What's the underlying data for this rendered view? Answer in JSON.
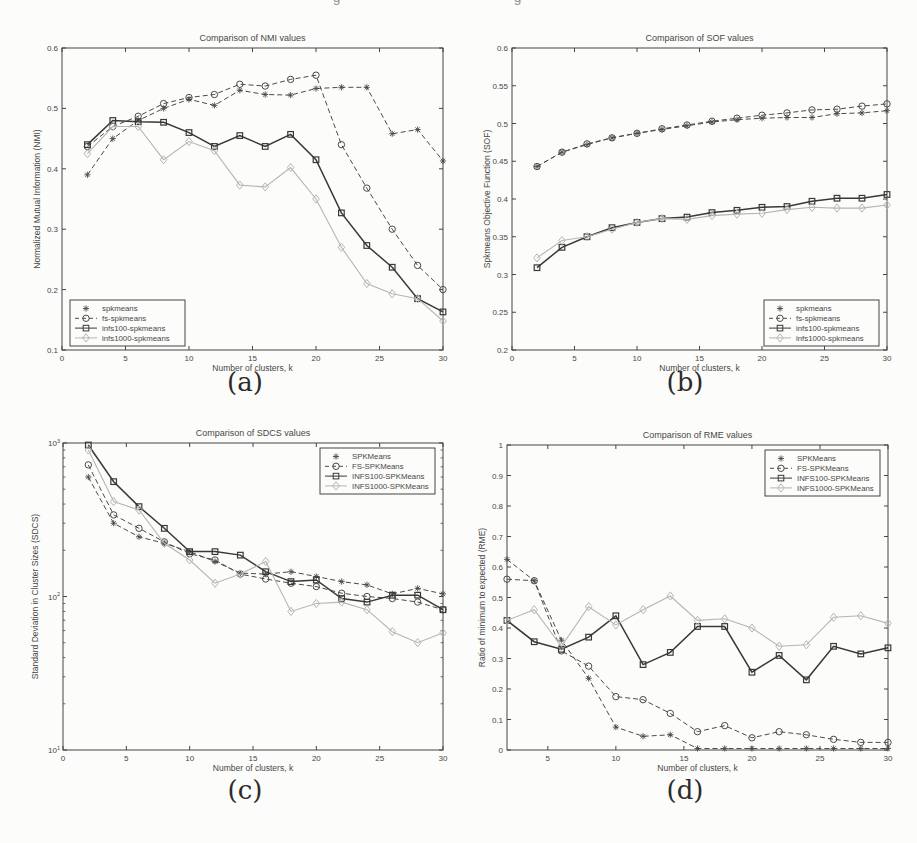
{
  "page": {
    "background": "#fcfcfa",
    "top_edge_fragments": [
      "g",
      "g"
    ]
  },
  "colors": {
    "axis": "#454545",
    "dark": "#4a4a4a",
    "darker": "#383838",
    "light": "#b5b5b5",
    "paper": "#fcfcfa"
  },
  "chart_data": [
    {
      "id": "a",
      "caption": "(a)",
      "type": "line",
      "title": "Comparison of NMI values",
      "xlabel": "Number of clusters, k",
      "ylabel": "Normalized Mutual Information (NMI)",
      "yscale": "linear",
      "xlim": [
        0,
        30
      ],
      "ylim": [
        0.1,
        0.6
      ],
      "xticks": [
        0,
        5,
        10,
        15,
        20,
        25,
        30
      ],
      "yticks": [
        0.1,
        0.2,
        0.3,
        0.4,
        0.5,
        0.6
      ],
      "legend_position": "bottom-left",
      "grid": false,
      "x": [
        2,
        4,
        6,
        8,
        10,
        12,
        14,
        16,
        18,
        20,
        22,
        24,
        26,
        28,
        30
      ],
      "series": [
        {
          "name": "spkmeans",
          "marker": "star",
          "line": "dashed",
          "shade": "dark",
          "values": [
            0.39,
            0.45,
            0.48,
            0.5,
            0.515,
            0.505,
            0.53,
            0.523,
            0.522,
            0.533,
            0.535,
            0.535,
            0.458,
            0.465,
            0.413
          ]
        },
        {
          "name": "fs-spkmeans",
          "marker": "circle",
          "line": "dashed",
          "shade": "dark",
          "values": [
            0.437,
            0.47,
            0.487,
            0.508,
            0.518,
            0.523,
            0.54,
            0.537,
            0.548,
            0.555,
            0.44,
            0.368,
            0.3,
            0.24,
            0.2
          ]
        },
        {
          "name": "infs100-spkmeans",
          "marker": "square",
          "line": "solid",
          "shade": "darker",
          "values": [
            0.44,
            0.48,
            0.478,
            0.477,
            0.46,
            0.437,
            0.455,
            0.437,
            0.457,
            0.415,
            0.327,
            0.273,
            0.237,
            0.185,
            0.163
          ]
        },
        {
          "name": "infs1000-spkmeans",
          "marker": "diamond",
          "line": "solid",
          "shade": "light",
          "values": [
            0.425,
            0.47,
            0.47,
            0.415,
            0.445,
            0.43,
            0.373,
            0.37,
            0.402,
            0.35,
            0.27,
            0.21,
            0.193,
            0.185,
            0.148
          ]
        }
      ]
    },
    {
      "id": "b",
      "caption": "(b)",
      "type": "line",
      "title": "Comparison of SOF values",
      "xlabel": "Number of clusters, k",
      "ylabel": "Spkmeans Objective Function (SOF)",
      "yscale": "linear",
      "xlim": [
        0,
        30
      ],
      "ylim": [
        0.2,
        0.6
      ],
      "xticks": [
        0,
        5,
        10,
        15,
        20,
        25,
        30
      ],
      "yticks": [
        0.2,
        0.25,
        0.3,
        0.35,
        0.4,
        0.45,
        0.5,
        0.55,
        0.6
      ],
      "legend_position": "bottom-right",
      "grid": false,
      "x": [
        2,
        4,
        6,
        8,
        10,
        12,
        14,
        16,
        18,
        20,
        22,
        24,
        26,
        28,
        30
      ],
      "series": [
        {
          "name": "spkmeans",
          "marker": "star",
          "line": "dashed",
          "shade": "dark",
          "values": [
            0.443,
            0.462,
            0.472,
            0.481,
            0.487,
            0.492,
            0.497,
            0.502,
            0.505,
            0.507,
            0.508,
            0.508,
            0.513,
            0.514,
            0.517
          ]
        },
        {
          "name": "fs-spkmeans",
          "marker": "circle",
          "line": "dashed",
          "shade": "dark",
          "values": [
            0.443,
            0.462,
            0.473,
            0.481,
            0.487,
            0.493,
            0.498,
            0.503,
            0.507,
            0.511,
            0.514,
            0.518,
            0.519,
            0.523,
            0.526
          ]
        },
        {
          "name": "infs100-spkmeans",
          "marker": "square",
          "line": "solid",
          "shade": "darker",
          "values": [
            0.309,
            0.336,
            0.35,
            0.362,
            0.369,
            0.374,
            0.376,
            0.382,
            0.385,
            0.389,
            0.39,
            0.397,
            0.401,
            0.401,
            0.406
          ]
        },
        {
          "name": "infs1000-spkmeans",
          "marker": "diamond",
          "line": "solid",
          "shade": "light",
          "values": [
            0.322,
            0.345,
            0.35,
            0.36,
            0.369,
            0.374,
            0.373,
            0.378,
            0.38,
            0.381,
            0.386,
            0.389,
            0.388,
            0.388,
            0.392
          ]
        }
      ]
    },
    {
      "id": "c",
      "caption": "(c)",
      "type": "line",
      "title": "Comparison of SDCS values",
      "xlabel": "Number of clusters, k",
      "ylabel": "Standard Deviation in Cluster Sizes (SDCS)",
      "yscale": "log",
      "xlim": [
        0,
        30
      ],
      "ylim": [
        10,
        1000
      ],
      "xticks": [
        0,
        5,
        10,
        15,
        20,
        25,
        30
      ],
      "yticks": [
        10,
        100,
        1000
      ],
      "legend_position": "top-right",
      "grid": false,
      "x": [
        2,
        4,
        6,
        8,
        10,
        12,
        14,
        16,
        18,
        20,
        22,
        24,
        26,
        28,
        30
      ],
      "series": [
        {
          "name": "SPKMeans",
          "marker": "star",
          "line": "dashed",
          "shade": "dark",
          "values": [
            600,
            300,
            245,
            222,
            196,
            169,
            142,
            140,
            145,
            135,
            125,
            119,
            104,
            113,
            104
          ]
        },
        {
          "name": "FS-SPKMeans",
          "marker": "circle",
          "line": "dashed",
          "shade": "dark",
          "values": [
            720,
            340,
            278,
            227,
            190,
            173,
            140,
            130,
            122,
            116,
            105,
            100,
            97,
            92,
            82
          ]
        },
        {
          "name": "INFS100-SPKMeans",
          "marker": "square",
          "line": "solid",
          "shade": "darker",
          "values": [
            970,
            560,
            385,
            278,
            196,
            196,
            186,
            145,
            125,
            128,
            97,
            92,
            102,
            102,
            82
          ]
        },
        {
          "name": "INFS1000-SPKMeans",
          "marker": "diamond",
          "line": "solid",
          "shade": "light",
          "values": [
            900,
            415,
            366,
            222,
            173,
            122,
            140,
            169,
            80,
            90,
            92,
            82,
            59,
            50,
            58
          ]
        }
      ]
    },
    {
      "id": "d",
      "caption": "(d)",
      "type": "line",
      "title": "Comparison of RME values",
      "xlabel": "Number of clusters, k",
      "ylabel": "Ratio of minimum to expected (RME)",
      "yscale": "linear",
      "xlim": [
        2,
        30
      ],
      "ylim": [
        0,
        1
      ],
      "xticks": [
        5,
        10,
        15,
        20,
        25,
        30
      ],
      "yticks": [
        0,
        0.1,
        0.2,
        0.3,
        0.4,
        0.5,
        0.6,
        0.7,
        0.8,
        0.9,
        1
      ],
      "legend_position": "top-right",
      "grid": false,
      "x": [
        2,
        4,
        6,
        8,
        10,
        12,
        14,
        16,
        18,
        20,
        22,
        24,
        26,
        28,
        30
      ],
      "series": [
        {
          "name": "SPKMeans",
          "marker": "star",
          "line": "dashed",
          "shade": "dark",
          "values": [
            0.625,
            0.555,
            0.36,
            0.235,
            0.075,
            0.045,
            0.05,
            0.005,
            0.005,
            0.005,
            0.005,
            0.005,
            0.005,
            0.005,
            0.005
          ]
        },
        {
          "name": "FS-SPKMeans",
          "marker": "circle",
          "line": "dashed",
          "shade": "dark",
          "values": [
            0.56,
            0.555,
            0.325,
            0.275,
            0.175,
            0.165,
            0.12,
            0.06,
            0.08,
            0.04,
            0.06,
            0.05,
            0.035,
            0.025,
            0.025
          ]
        },
        {
          "name": "INFS100-SPKMeans",
          "marker": "square",
          "line": "solid",
          "shade": "darker",
          "values": [
            0.425,
            0.355,
            0.33,
            0.37,
            0.44,
            0.28,
            0.32,
            0.405,
            0.405,
            0.255,
            0.31,
            0.23,
            0.34,
            0.315,
            0.335
          ]
        },
        {
          "name": "INFS1000-SPKMeans",
          "marker": "diamond",
          "line": "solid",
          "shade": "light",
          "values": [
            0.425,
            0.46,
            0.34,
            0.47,
            0.41,
            0.46,
            0.505,
            0.425,
            0.43,
            0.4,
            0.34,
            0.345,
            0.435,
            0.44,
            0.415
          ]
        }
      ]
    }
  ]
}
